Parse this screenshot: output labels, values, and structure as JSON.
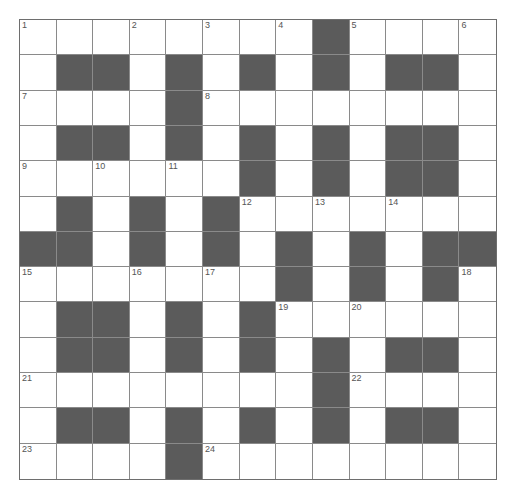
{
  "puzzle": {
    "rows": 13,
    "cols": 13,
    "colors": {
      "block": "#5b5b5b",
      "cell": "#ffffff",
      "line": "#8a8a8a",
      "number": "#555555"
    },
    "layout": [
      "0000000010000",
      "0110101010110",
      "0000100000000",
      "0110101010110",
      "0000001010110",
      "0101010000000",
      "1101010101011",
      "0000000101010",
      "0110101000000",
      "0110101010110",
      "0000000010000",
      "0110101010110",
      "0000100000000"
    ],
    "numbers": [
      {
        "label": "1",
        "row": 0,
        "col": 0
      },
      {
        "label": "2",
        "row": 0,
        "col": 3
      },
      {
        "label": "3",
        "row": 0,
        "col": 5
      },
      {
        "label": "4",
        "row": 0,
        "col": 7
      },
      {
        "label": "5",
        "row": 0,
        "col": 9
      },
      {
        "label": "6",
        "row": 0,
        "col": 12
      },
      {
        "label": "7",
        "row": 2,
        "col": 0
      },
      {
        "label": "8",
        "row": 2,
        "col": 5
      },
      {
        "label": "9",
        "row": 4,
        "col": 0
      },
      {
        "label": "10",
        "row": 4,
        "col": 2
      },
      {
        "label": "11",
        "row": 4,
        "col": 4
      },
      {
        "label": "12",
        "row": 5,
        "col": 6
      },
      {
        "label": "13",
        "row": 5,
        "col": 8
      },
      {
        "label": "14",
        "row": 5,
        "col": 10
      },
      {
        "label": "15",
        "row": 7,
        "col": 0
      },
      {
        "label": "16",
        "row": 7,
        "col": 3
      },
      {
        "label": "17",
        "row": 7,
        "col": 5
      },
      {
        "label": "18",
        "row": 7,
        "col": 12
      },
      {
        "label": "19",
        "row": 8,
        "col": 7
      },
      {
        "label": "20",
        "row": 8,
        "col": 9
      },
      {
        "label": "21",
        "row": 10,
        "col": 0
      },
      {
        "label": "22",
        "row": 10,
        "col": 9
      },
      {
        "label": "23",
        "row": 12,
        "col": 0
      },
      {
        "label": "24",
        "row": 12,
        "col": 5
      }
    ]
  }
}
